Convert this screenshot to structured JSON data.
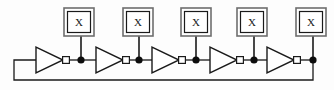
{
  "diagram": {
    "type": "circuit-schematic",
    "width": 334,
    "height": 90,
    "colors": {
      "background": "#fdfdfd",
      "wire": "#1a1a1a",
      "gate_outline": "#1a1a1a",
      "gate_fill": "#ffffff",
      "bubble_fill": "#ffffff",
      "junction_fill": "#0d0d0d",
      "box_outer_stroke": "#6e6e6e",
      "box_inner_stroke": "#1a1a1a",
      "box_fill": "#ffffff",
      "text": "#1a1a1a"
    },
    "stage_count": 5,
    "stages": [
      {
        "index": 1,
        "inverter": {
          "name": "inverter-1",
          "tri_x": 36,
          "tri_y": 47,
          "tri_w": 27,
          "tri_h": 26,
          "bubble_cx": 66,
          "bubble_cy": 60,
          "bubble_r": 3.4
        },
        "junction": {
          "cx": 81,
          "cy": 60,
          "r": 3.6
        },
        "stub": {
          "x": 81,
          "y1": 36,
          "y2": 60
        },
        "load_box": {
          "name": "load-box-1",
          "label": "X",
          "x": 64,
          "y": 8,
          "w": 30,
          "h": 28,
          "inner_inset": 3.5,
          "label_x": 79,
          "label_y": 26
        }
      },
      {
        "index": 2,
        "inverter": {
          "name": "inverter-2",
          "tri_x": 96,
          "tri_y": 47,
          "tri_w": 27,
          "tri_h": 26,
          "bubble_cx": 126,
          "bubble_cy": 60,
          "bubble_r": 3.4
        },
        "junction": {
          "cx": 139,
          "cy": 60,
          "r": 3.6
        },
        "stub": {
          "x": 139,
          "y1": 36,
          "y2": 60
        },
        "load_box": {
          "name": "load-box-2",
          "label": "X",
          "x": 123,
          "y": 8,
          "w": 30,
          "h": 28,
          "inner_inset": 3.5,
          "label_x": 138,
          "label_y": 26
        }
      },
      {
        "index": 3,
        "inverter": {
          "name": "inverter-3",
          "tri_x": 152,
          "tri_y": 47,
          "tri_w": 27,
          "tri_h": 26,
          "bubble_cx": 182,
          "bubble_cy": 60,
          "bubble_r": 3.4
        },
        "junction": {
          "cx": 196,
          "cy": 60,
          "r": 3.6
        },
        "stub": {
          "x": 196,
          "y1": 36,
          "y2": 60
        },
        "load_box": {
          "name": "load-box-3",
          "label": "X",
          "x": 181,
          "y": 8,
          "w": 30,
          "h": 28,
          "inner_inset": 3.5,
          "label_x": 196,
          "label_y": 26
        }
      },
      {
        "index": 4,
        "inverter": {
          "name": "inverter-4",
          "tri_x": 210,
          "tri_y": 47,
          "tri_w": 27,
          "tri_h": 26,
          "bubble_cx": 240,
          "bubble_cy": 60,
          "bubble_r": 3.4
        },
        "junction": {
          "cx": 254,
          "cy": 60,
          "r": 3.6
        },
        "stub": {
          "x": 254,
          "y1": 36,
          "y2": 60
        },
        "load_box": {
          "name": "load-box-4",
          "label": "X",
          "x": 237,
          "y": 8,
          "w": 30,
          "h": 28,
          "inner_inset": 3.5,
          "label_x": 252,
          "label_y": 26
        }
      },
      {
        "index": 5,
        "inverter": {
          "name": "inverter-5",
          "tri_x": 267,
          "tri_y": 47,
          "tri_w": 27,
          "tri_h": 26,
          "bubble_cx": 297,
          "bubble_cy": 60,
          "bubble_r": 3.4
        },
        "junction": {
          "cx": 313,
          "cy": 60,
          "r": 3.6
        },
        "stub": {
          "x": 313,
          "y1": 36,
          "y2": 60
        },
        "load_box": {
          "name": "load-box-5",
          "label": "X",
          "x": 296,
          "y": 8,
          "w": 30,
          "h": 28,
          "inner_inset": 3.5,
          "label_x": 311,
          "label_y": 26
        }
      }
    ],
    "interconnects": [
      {
        "name": "wire-stage1-to-stage2",
        "d": "M 81 60 L 96 60"
      },
      {
        "name": "wire-stage2-to-stage3",
        "d": "M 139 60 L 152 60"
      },
      {
        "name": "wire-stage3-to-stage4",
        "d": "M 196 60 L 210 60"
      },
      {
        "name": "wire-stage4-to-stage5",
        "d": "M 254 60 L 267 60"
      },
      {
        "name": "wire-bubble1-to-junction1",
        "d": "M 69.4 60 L 81 60"
      },
      {
        "name": "wire-bubble2-to-junction2",
        "d": "M 129.4 60 L 139 60"
      },
      {
        "name": "wire-bubble3-to-junction3",
        "d": "M 185.4 60 L 196 60"
      },
      {
        "name": "wire-bubble4-to-junction4",
        "d": "M 243.4 60 L 254 60"
      },
      {
        "name": "wire-bubble5-to-junction5",
        "d": "M 300.4 60 L 313 60"
      }
    ],
    "feedback_path": {
      "name": "feedback-wire",
      "d": "M 313 60 L 313 80 L 14 80 L 14 60 L 36 60",
      "description": "output of last inverter routed back to input of first inverter"
    }
  }
}
